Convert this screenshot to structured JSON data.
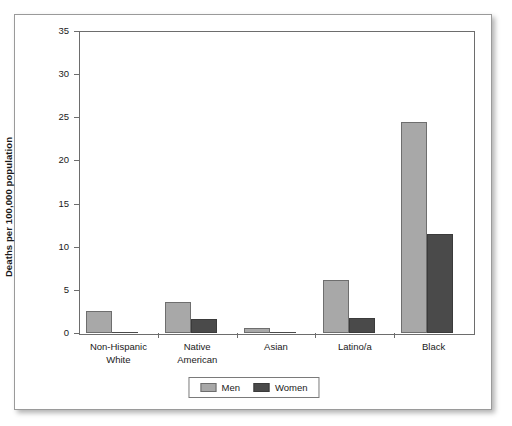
{
  "chart_data": {
    "type": "bar",
    "title": "",
    "subtitle": "",
    "xlabel": "",
    "ylabel": "Deaths per 100,000 population",
    "ylim": [
      0,
      35
    ],
    "ytick_labels": [
      "0",
      "5",
      "10",
      "15",
      "20",
      "25",
      "30",
      "35"
    ],
    "ytick_values": [
      0,
      5,
      10,
      15,
      20,
      25,
      30,
      35
    ],
    "grid": false,
    "legend_position": "bottom-center",
    "categories": [
      "Non-Hispanic\nWhite",
      "Native\nAmerican",
      "Asian",
      "Latino/a",
      "Black"
    ],
    "category_lines": [
      [
        "Non-Hispanic",
        "White"
      ],
      [
        "Native",
        "American"
      ],
      [
        "Asian"
      ],
      [
        "Latino/a"
      ],
      [
        "Black"
      ]
    ],
    "series": [
      {
        "name": "Men",
        "color": "#a8a8a8",
        "values": [
          2.5,
          3.6,
          0.6,
          6.2,
          24.5
        ]
      },
      {
        "name": "Women",
        "color": "#4a4a4a",
        "values": [
          0.1,
          1.6,
          0.02,
          1.7,
          11.5
        ]
      }
    ]
  },
  "legend": {
    "entries": [
      {
        "label": "Men"
      },
      {
        "label": "Women"
      }
    ]
  },
  "colors": {
    "men": "#a8a8a8",
    "women": "#4a4a4a",
    "axis": "#6d6d6d",
    "text": "#1a1a1a",
    "card_border": "#9a9a9a",
    "background": "#ffffff"
  }
}
